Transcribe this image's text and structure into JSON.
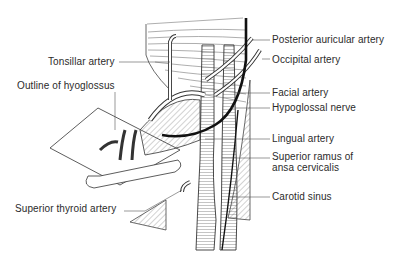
{
  "diagram": {
    "type": "anatomical-line-drawing",
    "colors": {
      "line": "#2a2a2a",
      "hatch": "#555555",
      "background": "#ffffff"
    },
    "labels": {
      "tonsillar_artery": "Tonsillar artery",
      "outline_of_hyoglossus": "Outline of hyoglossus",
      "superior_thyroid_artery": "Superior thyroid artery",
      "posterior_auricular_artery": "Posterior auricular artery",
      "occipital_artery": "Occipital artery",
      "facial_artery": "Facial artery",
      "hypoglossal_nerve": "Hypoglossal nerve",
      "lingual_artery": "Lingual artery",
      "superior_ramus_line1": "Superior ramus of",
      "superior_ramus_line2": "ansa cervicalis",
      "carotid_sinus": "Carotid sinus"
    }
  }
}
